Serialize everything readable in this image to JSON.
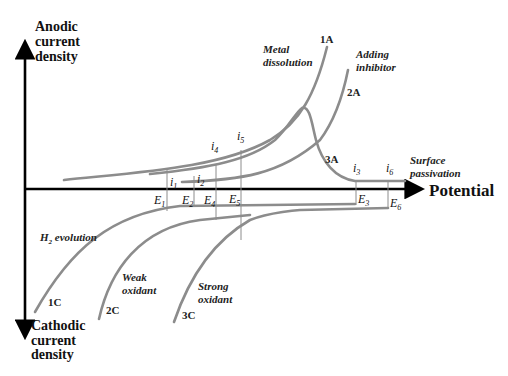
{
  "axes": {
    "y_top_label": [
      "Anodic",
      "current",
      "density"
    ],
    "y_bottom_label": [
      "Cathodic",
      "current",
      "density"
    ],
    "x_label": "Potential"
  },
  "curves": {
    "anodic": [
      {
        "id": "1A",
        "description": [
          "Metal",
          "dissolution"
        ]
      },
      {
        "id": "2A",
        "description": [
          "Adding",
          "inhibitor"
        ]
      },
      {
        "id": "3A",
        "description": [
          "Surface",
          "passivation"
        ]
      }
    ],
    "cathodic": [
      {
        "id": "1C",
        "description": [
          "H",
          "2",
          " evolution"
        ]
      },
      {
        "id": "2C",
        "description": [
          "Weak",
          "oxidant"
        ]
      },
      {
        "id": "3C",
        "description": [
          "Strong",
          "oxidant"
        ]
      }
    ]
  },
  "markers": {
    "currents": [
      {
        "base": "i",
        "sub": "1"
      },
      {
        "base": "i",
        "sub": "2"
      },
      {
        "base": "i",
        "sub": "3"
      },
      {
        "base": "i",
        "sub": "4"
      },
      {
        "base": "i",
        "sub": "5"
      },
      {
        "base": "i",
        "sub": "6"
      }
    ],
    "potentials": [
      {
        "base": "E",
        "sub": "1"
      },
      {
        "base": "E",
        "sub": "2"
      },
      {
        "base": "E",
        "sub": "3"
      },
      {
        "base": "E",
        "sub": "4"
      },
      {
        "base": "E",
        "sub": "5"
      },
      {
        "base": "E",
        "sub": "6"
      }
    ]
  },
  "colors": {
    "curve": "#8c8c8c",
    "axis": "#000000"
  }
}
